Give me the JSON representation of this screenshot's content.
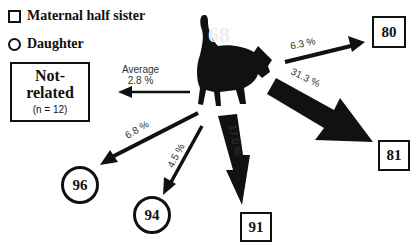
{
  "legend": {
    "items": [
      {
        "icon": "square-icon",
        "label": "Maternal half sister"
      },
      {
        "icon": "circle-icon",
        "label": "Daughter"
      }
    ]
  },
  "center": {
    "id": "68",
    "icon": "cat-icon"
  },
  "not_related": {
    "title_line1": "Not-",
    "title_line2": "related",
    "n_label": "(n = 12)",
    "arrow_label_line1": "Average",
    "arrow_label_line2": "2.8 %"
  },
  "nodes": [
    {
      "id": "80",
      "type": "square",
      "percent": "6.3 %"
    },
    {
      "id": "81",
      "type": "square",
      "percent": "31.3 %"
    },
    {
      "id": "91",
      "type": "square",
      "percent": "17.0 %"
    },
    {
      "id": "94",
      "type": "circle",
      "percent": "4.5 %"
    },
    {
      "id": "96",
      "type": "circle",
      "percent": "6.8 %"
    }
  ],
  "colors": {
    "ink": "#111111",
    "label": "#333333",
    "background": "#ffffff"
  }
}
